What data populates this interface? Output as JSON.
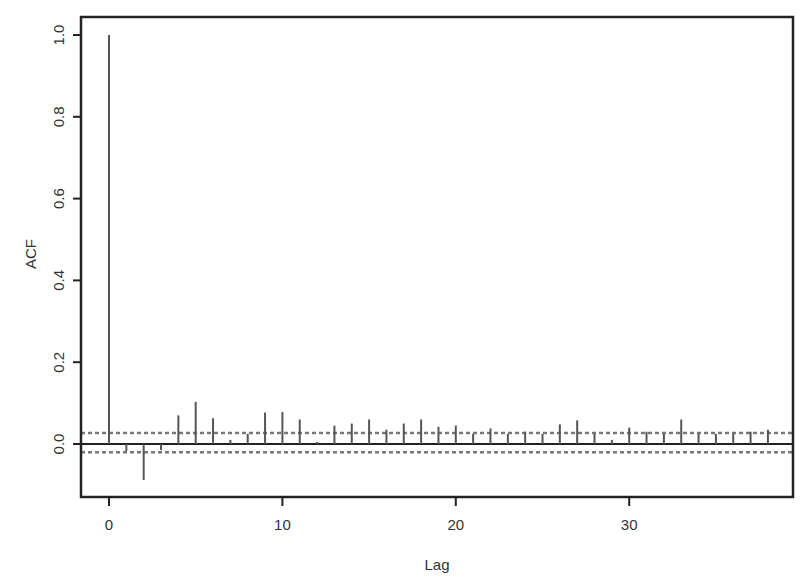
{
  "chart_data": {
    "type": "bar",
    "subtype": "acf-stem",
    "title": "",
    "xlabel": "Lag",
    "ylabel": "ACF",
    "xlim": [
      -1.6,
      39.5
    ],
    "ylim": [
      -0.13,
      1.04
    ],
    "xticks": [
      0,
      10,
      20,
      30
    ],
    "xtick_labels": [
      "0",
      "10",
      "20",
      "30"
    ],
    "yticks": [
      0.0,
      0.2,
      0.4,
      0.6,
      0.8,
      1.0
    ],
    "ytick_labels": [
      "0.0",
      "0.2",
      "0.4",
      "0.6",
      "0.8",
      "1.0"
    ],
    "grid": false,
    "legend": null,
    "confidence_band": {
      "upper": 0.027,
      "lower": -0.02,
      "style": "dashed"
    },
    "lags": [
      0,
      1,
      2,
      3,
      4,
      5,
      6,
      7,
      8,
      9,
      10,
      11,
      12,
      13,
      14,
      15,
      16,
      17,
      18,
      19,
      20,
      21,
      22,
      23,
      24,
      25,
      26,
      27,
      28,
      29,
      30,
      31,
      32,
      33,
      34,
      35,
      36,
      37,
      38
    ],
    "values": [
      1.0,
      -0.017,
      -0.088,
      -0.015,
      0.07,
      0.103,
      0.063,
      0.01,
      0.025,
      0.077,
      0.078,
      0.06,
      0.005,
      0.045,
      0.05,
      0.06,
      0.035,
      0.05,
      0.06,
      0.042,
      0.045,
      0.025,
      0.038,
      0.025,
      0.03,
      0.025,
      0.048,
      0.058,
      0.025,
      0.01,
      0.04,
      0.03,
      0.025,
      0.06,
      0.025,
      0.025,
      0.025,
      0.03,
      0.035
    ]
  },
  "colors": {
    "frame": "#222222",
    "bars": "#555555",
    "band": "#777777",
    "text": "#333333"
  }
}
